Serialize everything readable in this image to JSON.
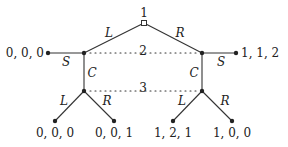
{
  "diagram": {
    "type": "extensive-form game tree",
    "colors": {
      "line": "#333333",
      "text": "#222222",
      "background": "#ffffff"
    },
    "root": {
      "player_label": "1",
      "x": 144,
      "y": 23
    },
    "root_actions": {
      "left": "L",
      "right": "R"
    },
    "info_sets": [
      {
        "label": "2",
        "y": 53
      },
      {
        "label": "3",
        "y": 91
      }
    ],
    "player2_nodes": {
      "left": {
        "x": 84,
        "y": 53,
        "stop_action": "S",
        "continue_action": "C",
        "stop_payoff": "0, 0, 0"
      },
      "right": {
        "x": 202,
        "y": 53,
        "stop_action": "S",
        "continue_action": "C",
        "stop_payoff": "1, 1, 2"
      }
    },
    "player3_nodes": {
      "left": {
        "x": 84,
        "y": 91,
        "actions": [
          "L",
          "R"
        ],
        "payoffs": [
          "0, 0, 0",
          "0, 0, 1"
        ]
      },
      "right": {
        "x": 202,
        "y": 91,
        "actions": [
          "L",
          "R"
        ],
        "payoffs": [
          "1, 2, 1",
          "1, 0, 0"
        ]
      }
    }
  }
}
